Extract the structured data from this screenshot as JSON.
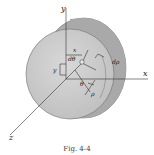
{
  "diagram": {
    "type": "cylinder-polar-element",
    "axes": {
      "x": "x",
      "y": "y",
      "z": "z"
    },
    "labels": {
      "x_offset": "x",
      "y_offset": "y",
      "d_theta": "dθ",
      "d_rho": "dρ",
      "theta": "θ",
      "rho": "ρ"
    },
    "colors": {
      "face": "#c9c9c9",
      "side": "#a8a8a8",
      "edge": "#6f6f6f",
      "axis": "#333333"
    }
  },
  "caption": "Fig. 4-4"
}
